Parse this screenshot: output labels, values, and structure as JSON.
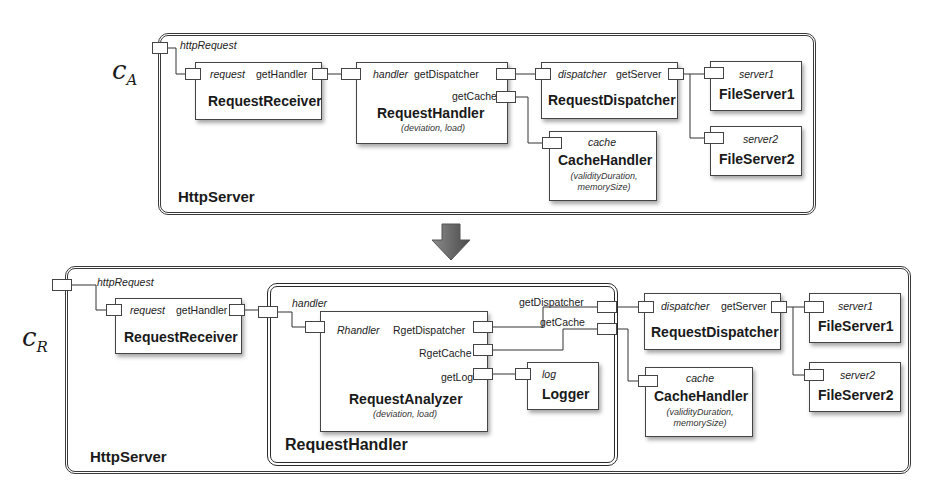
{
  "configurations": {
    "top": {
      "label": "c",
      "label_sub": "A",
      "container": "HttpServer",
      "external_port": "httpRequest",
      "components": {
        "receiver": {
          "name": "RequestReceiver",
          "ports": [
            "request",
            "getHandler"
          ]
        },
        "handler": {
          "name": "RequestHandler",
          "params": "(deviation, load)",
          "ports": [
            "handler",
            "getDispatcher",
            "getCache"
          ]
        },
        "dispatcher": {
          "name": "RequestDispatcher",
          "ports": [
            "dispatcher",
            "getServer"
          ]
        },
        "cache": {
          "name": "CacheHandler",
          "params_line1": "(validityDuration,",
          "params_line2": "memorySize)",
          "ports": [
            "cache"
          ]
        },
        "fs1": {
          "name": "FileServer1",
          "ports": [
            "server1"
          ]
        },
        "fs2": {
          "name": "FileServer2",
          "ports": [
            "server2"
          ]
        }
      }
    },
    "transition_arrow": "arrow-down-icon",
    "bottom": {
      "label": "c",
      "label_sub": "R",
      "container": "HttpServer",
      "external_port": "httpRequest",
      "composite": {
        "name": "RequestHandler",
        "external_ports": [
          "handler",
          "getDispatcher",
          "getCache"
        ]
      },
      "components": {
        "receiver": {
          "name": "RequestReceiver",
          "ports": [
            "request",
            "getHandler"
          ]
        },
        "analyzer": {
          "name": "RequestAnalyzer",
          "params": "(deviation, load)",
          "ports": [
            "Rhandler",
            "RgetDispatcher",
            "RgetCache",
            "getLog"
          ]
        },
        "logger": {
          "name": "Logger",
          "ports": [
            "log"
          ]
        },
        "dispatcher": {
          "name": "RequestDispatcher",
          "ports": [
            "dispatcher",
            "getServer"
          ]
        },
        "cache": {
          "name": "CacheHandler",
          "params_line1": "(validityDuration,",
          "params_line2": "memorySize)",
          "ports": [
            "cache"
          ]
        },
        "fs1": {
          "name": "FileServer1",
          "ports": [
            "server1"
          ]
        },
        "fs2": {
          "name": "FileServer2",
          "ports": [
            "server2"
          ]
        }
      }
    }
  }
}
